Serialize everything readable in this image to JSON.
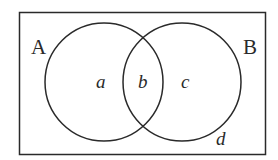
{
  "diagram": {
    "type": "venn",
    "universe_region_label": "d",
    "sets": [
      {
        "name": "A",
        "label": "A"
      },
      {
        "name": "B",
        "label": "B"
      }
    ],
    "regions": [
      {
        "id": "a",
        "label": "a",
        "description": "A only"
      },
      {
        "id": "b",
        "label": "b",
        "description": "A and B"
      },
      {
        "id": "c",
        "label": "c",
        "description": "B only"
      },
      {
        "id": "d",
        "label": "d",
        "description": "outside A and B"
      }
    ],
    "colors": {
      "stroke": "#2a2a2a",
      "background": "#ffffff"
    }
  }
}
